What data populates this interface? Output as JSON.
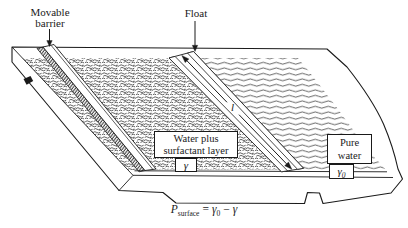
{
  "palette": {
    "ink": "#1a1a1a",
    "paper": "#ffffff"
  },
  "callouts": {
    "movable_barrier": "Movable\nbarrier",
    "float": "Float"
  },
  "float_annotation": {
    "length_symbol": "l"
  },
  "region_labels": {
    "surfactant": {
      "name": "Water plus\nsurfactant layer",
      "tension_symbol": "γ"
    },
    "pure_water": {
      "name": "Pure\nwater",
      "tension_symbol_base": "γ",
      "tension_symbol_sub": "0"
    }
  },
  "caption": {
    "lhs_base": "P",
    "lhs_sub": "surface",
    "equals": "=",
    "rhs_gamma0_base": "γ",
    "rhs_gamma0_sub": "0",
    "minus": "−",
    "rhs_gamma": "γ"
  }
}
